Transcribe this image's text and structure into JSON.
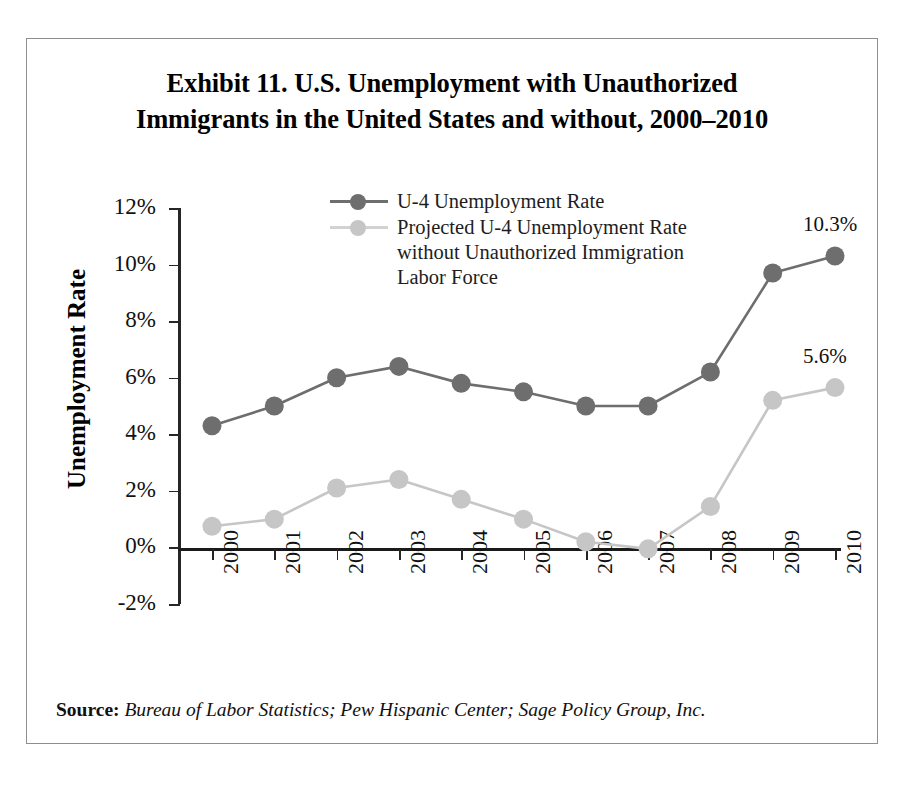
{
  "chart_data": {
    "type": "line",
    "title": "Exhibit 11. U.S. Unemployment with Unauthorized Immigrants in the United States and without, 2000–2010",
    "title_lines": [
      "Exhibit 11. U.S. Unemployment with Unauthorized",
      "Immigrants in the United States and without, 2000–2010"
    ],
    "xlabel": "",
    "ylabel": "Unemployment Rate",
    "categories": [
      "2000",
      "2001",
      "2002",
      "2003",
      "2004",
      "2005",
      "2006",
      "2007",
      "2008",
      "2009",
      "2010"
    ],
    "ylim": [
      -2,
      12
    ],
    "yticks": [
      "-2%",
      "0%",
      "2%",
      "4%",
      "6%",
      "8%",
      "10%",
      "12%"
    ],
    "ytick_values": [
      -2,
      0,
      2,
      4,
      6,
      8,
      10,
      12
    ],
    "grid": false,
    "legend_position": "top-center",
    "series": [
      {
        "name": "U-4 Unemployment Rate",
        "color": "#6e6e6e",
        "values": [
          4.3,
          5.0,
          6.0,
          6.4,
          5.8,
          5.5,
          5.0,
          5.0,
          6.2,
          9.7,
          10.3
        ],
        "end_label": "10.3%"
      },
      {
        "name": "Projected U-4 Unemployment Rate without Unauthorized Immigration Labor Force",
        "name_lines": [
          "Projected U-4 Unemployment Rate",
          "without Unauthorized Immigration",
          "Labor Force"
        ],
        "color": "#c6c6c6",
        "values": [
          0.75,
          1.0,
          2.1,
          2.4,
          1.7,
          1.0,
          0.2,
          -0.05,
          1.45,
          5.2,
          5.65
        ],
        "end_label": "5.6%"
      }
    ],
    "annotations": [
      {
        "text": "10.3%",
        "series": 0,
        "category": "2010"
      },
      {
        "text": "5.6%",
        "series": 1,
        "category": "2010"
      }
    ]
  },
  "source": {
    "label": "Source:",
    "text": "Bureau of Labor Statistics; Pew Hispanic Center; Sage Policy Group, Inc."
  },
  "colors": {
    "series_dark": "#6e6e6e",
    "series_light": "#c6c6c6",
    "axis": "#1a1a1a",
    "frame": "#8e8e8e",
    "text": "#111111"
  }
}
